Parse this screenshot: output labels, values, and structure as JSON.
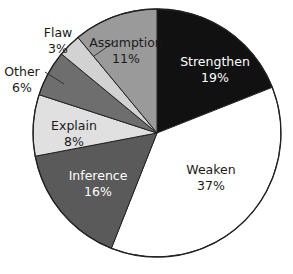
{
  "chart_data": {
    "type": "pie",
    "title": "",
    "subtitle": "",
    "xlabel": "",
    "ylabel": "",
    "legend_position": "none",
    "grid": false,
    "units": "percent",
    "start_angle_deg": 0,
    "direction": "clockwise",
    "categories": [
      "Strengthen",
      "Weaken",
      "Inference",
      "Explain",
      "Other",
      "Flaw",
      "Assumption"
    ],
    "values": [
      19,
      37,
      16,
      8,
      6,
      3,
      11
    ],
    "slices": [
      {
        "name": "Strengthen",
        "label": "Strengthen",
        "percent": 19,
        "percent_text": "19%",
        "color": "#111111",
        "text_color": "#ffffff",
        "label_placement": "inside"
      },
      {
        "name": "Weaken",
        "label": "Weaken",
        "percent": 37,
        "percent_text": "37%",
        "color": "#ffffff",
        "text_color": "#1a1a1a",
        "label_placement": "inside"
      },
      {
        "name": "Inference",
        "label": "Inference",
        "percent": 16,
        "percent_text": "16%",
        "color": "#5a5a5a",
        "text_color": "#ffffff",
        "label_placement": "inside"
      },
      {
        "name": "Explain",
        "label": "Explain",
        "percent": 8,
        "percent_text": "8%",
        "color": "#e0e0e0",
        "text_color": "#1a1a1a",
        "label_placement": "inside"
      },
      {
        "name": "Other",
        "label": "Other",
        "percent": 6,
        "percent_text": "6%",
        "color": "#6e6e6e",
        "text_color": "#1a1a1a",
        "label_placement": "outside"
      },
      {
        "name": "Flaw",
        "label": "Flaw",
        "percent": 3,
        "percent_text": "3%",
        "color": "#d2d2d2",
        "text_color": "#1a1a1a",
        "label_placement": "outside"
      },
      {
        "name": "Assumption",
        "label": "Assumption",
        "percent": 11,
        "percent_text": "11%",
        "color": "#9a9a9a",
        "text_color": "#1a1a1a",
        "label_placement": "inside"
      }
    ],
    "background_color": "#ffffff",
    "outline_color": "#222222"
  }
}
